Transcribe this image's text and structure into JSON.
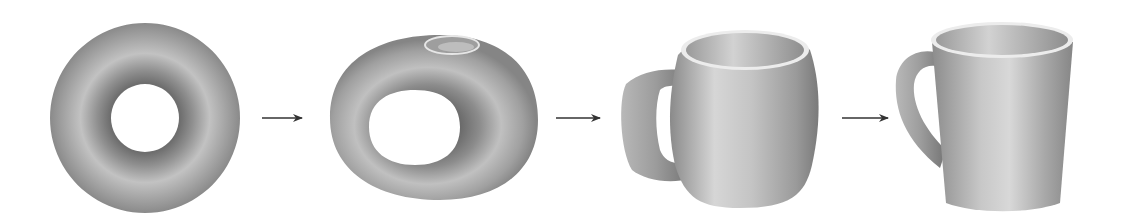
{
  "diagram": {
    "type": "topological-homeomorphism-sequence",
    "stages": [
      {
        "id": "torus",
        "label": "torus (donut)"
      },
      {
        "id": "torus-with-dent",
        "label": "torus with depression forming"
      },
      {
        "id": "rounded-mug",
        "label": "rounded mug"
      },
      {
        "id": "coffee-mug",
        "label": "coffee mug"
      }
    ],
    "arrows": 3,
    "colors": {
      "background": "#ffffff",
      "surface_light": "#d4d4d4",
      "surface_mid": "#a6a6a6",
      "surface_dark": "#7a7a7a",
      "arrow": "#333333"
    }
  }
}
